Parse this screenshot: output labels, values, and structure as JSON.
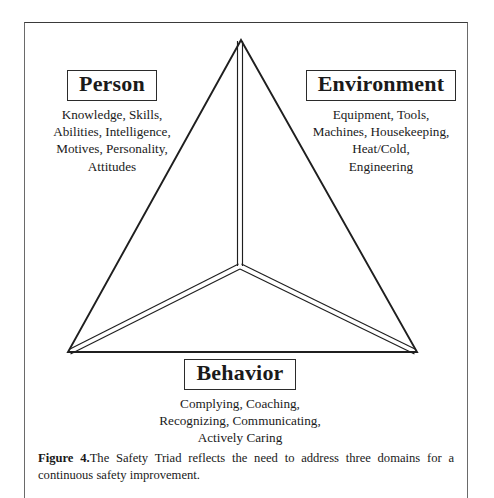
{
  "figure": {
    "diagram_title": "The Safety Triad",
    "corners": [
      {
        "id": "person",
        "title": "Person",
        "items": [
          "Knowledge, Skills,",
          "Abilities, Intelligence,",
          "Motives, Personality,",
          "Attitudes"
        ]
      },
      {
        "id": "environment",
        "title": "Environment",
        "items": [
          "Equipment, Tools,",
          "Machines, Housekeeping,",
          "Heat/Cold,",
          "Engineering"
        ]
      },
      {
        "id": "behavior",
        "title": "Behavior",
        "items": [
          "Complying, Coaching,",
          "Recognizing, Communicating,",
          "Actively Caring"
        ]
      }
    ]
  },
  "caption": {
    "label": "Figure 4.",
    "text": "The Safety Triad reflects the need to address three domains for a continuous safety improvement."
  },
  "colors": {
    "ink": "#1a1a1a",
    "line": "#2b2b2b",
    "frame": "#6a6a6a",
    "background": "#ffffff"
  }
}
